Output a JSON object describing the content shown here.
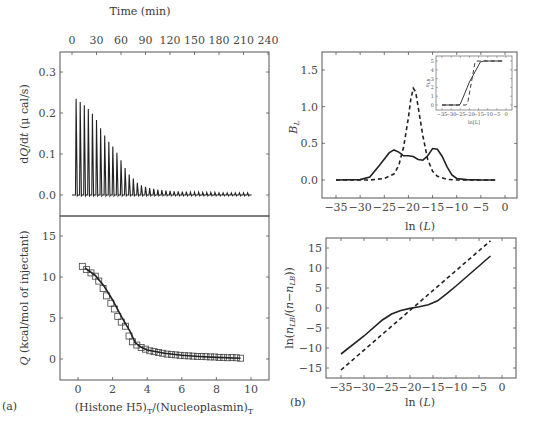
{
  "panels": {
    "a_label": "(a)",
    "b_label": "(b)"
  },
  "chart_data": [
    {
      "id": "itc-thermogram",
      "type": "line",
      "title": "",
      "xlabel": "Time (min)",
      "ylabel": "dQ/dt (μ cal/s)",
      "x_ticks": [
        "0",
        "30",
        "60",
        "90",
        "120",
        "150",
        "180",
        "210",
        "240"
      ],
      "y_ticks": [
        "0.0",
        "0.1",
        "0.2",
        "0.3"
      ],
      "xlim": [
        0,
        240
      ],
      "ylim": [
        -0.05,
        0.35
      ],
      "grid": false,
      "series": [
        {
          "name": "injection peaks",
          "peak_times_min": [
            5,
            10,
            15,
            20,
            25,
            30,
            35,
            40,
            45,
            50,
            55,
            60,
            65,
            70,
            75,
            80,
            85,
            90,
            95,
            100,
            105,
            110,
            115,
            120,
            125,
            130,
            135,
            140,
            145,
            150,
            155,
            160,
            165,
            170,
            175,
            180,
            185,
            190,
            195,
            200,
            205,
            210,
            215
          ],
          "peak_heights": [
            0.235,
            0.227,
            0.219,
            0.21,
            0.198,
            0.183,
            0.163,
            0.145,
            0.13,
            0.118,
            0.103,
            0.085,
            0.066,
            0.05,
            0.04,
            0.03,
            0.024,
            0.02,
            0.017,
            0.015,
            0.013,
            0.012,
            0.011,
            0.01,
            0.009,
            0.009,
            0.008,
            0.008,
            0.007,
            0.007,
            0.007,
            0.006,
            0.006,
            0.006,
            0.006,
            0.005,
            0.005,
            0.005,
            0.005,
            0.005,
            0.005,
            0.005,
            0.005
          ]
        }
      ]
    },
    {
      "id": "binding-isotherm",
      "type": "scatter",
      "xlabel": "(Histone H5)T/(Nucleoplasmin)T",
      "xlabel_main": "(Histone H5)",
      "xlabel_sub1": "T",
      "xlabel_mid": "/(Nucleoplasmin)",
      "xlabel_sub2": "T",
      "ylabel": "Q (kcal/mol of injectant)",
      "x_ticks": [
        "0",
        "2",
        "4",
        "6",
        "8",
        "10"
      ],
      "y_ticks": [
        "0",
        "5",
        "10",
        "15"
      ],
      "xlim": [
        -1,
        11
      ],
      "ylim": [
        -2.5,
        17.5
      ],
      "series": [
        {
          "name": "data (squares)",
          "x": [
            0.25,
            0.5,
            0.75,
            1.0,
            1.2,
            1.45,
            1.65,
            1.9,
            2.1,
            2.3,
            2.5,
            2.75,
            2.95,
            3.15,
            3.4,
            3.65,
            3.9,
            4.15,
            4.4,
            4.65,
            4.9,
            5.15,
            5.4,
            5.65,
            5.9,
            6.15,
            6.4,
            6.65,
            6.9,
            7.15,
            7.4,
            7.65,
            7.9,
            8.15,
            8.4,
            8.65,
            8.9,
            9.15,
            9.4
          ],
          "y": [
            11.3,
            10.9,
            10.5,
            10.1,
            9.5,
            8.6,
            7.7,
            6.8,
            6.1,
            5.2,
            4.5,
            4.0,
            2.8,
            2.1,
            1.7,
            1.4,
            1.2,
            1.0,
            0.9,
            0.8,
            0.7,
            0.6,
            0.55,
            0.5,
            0.45,
            0.4,
            0.38,
            0.35,
            0.3,
            0.3,
            0.28,
            0.25,
            0.25,
            0.2,
            0.2,
            0.15,
            0.2,
            0.15,
            0.1
          ]
        },
        {
          "name": "fit (line)",
          "x": [
            0.4,
            1.0,
            1.5,
            2.0,
            2.5,
            3.0,
            3.3,
            3.6,
            4.0,
            5.0,
            6.0,
            7.0,
            8.0,
            9.4
          ],
          "y": [
            11.1,
            10.2,
            8.9,
            7.2,
            5.2,
            3.4,
            2.0,
            1.5,
            1.1,
            0.7,
            0.45,
            0.3,
            0.2,
            0.1
          ]
        }
      ]
    },
    {
      "id": "binding-capacity",
      "type": "line",
      "xlabel": "ln (L)",
      "ylabel": "B_L",
      "x_ticks": [
        "-35",
        "-30",
        "-25",
        "-20",
        "-15",
        "-10",
        "-5",
        "0"
      ],
      "y_ticks": [
        "0.0",
        "0.5",
        "1.0",
        "1.5"
      ],
      "xlim": [
        -38,
        2.5
      ],
      "ylim": [
        -0.25,
        1.75
      ],
      "series": [
        {
          "name": "solid",
          "style": "solid",
          "x": [
            -35,
            -30,
            -28,
            -26,
            -24,
            -23,
            -22,
            -21,
            -20,
            -19,
            -18,
            -17,
            -16,
            -15,
            -14,
            -13,
            -12,
            -11,
            -10,
            -8,
            -5,
            -2
          ],
          "y": [
            0,
            0.005,
            0.04,
            0.2,
            0.37,
            0.41,
            0.38,
            0.33,
            0.33,
            0.32,
            0.28,
            0.27,
            0.33,
            0.43,
            0.42,
            0.32,
            0.18,
            0.07,
            0.02,
            0.005,
            0,
            0
          ]
        },
        {
          "name": "dashed",
          "style": "dashed",
          "x": [
            -35,
            -28,
            -25,
            -23,
            -22,
            -21,
            -20,
            -19.5,
            -19,
            -18.5,
            -18,
            -17,
            -16,
            -15,
            -14,
            -12,
            -10,
            -5,
            -2
          ],
          "y": [
            0,
            0,
            0.02,
            0.08,
            0.2,
            0.45,
            0.85,
            1.1,
            1.25,
            1.2,
            1.0,
            0.6,
            0.28,
            0.12,
            0.05,
            0.01,
            0,
            0,
            0
          ]
        }
      ],
      "inset": {
        "xlabel": "ln[L]",
        "ylabel": "n_LB",
        "x_ticks": [
          "-35",
          "-30",
          "-25",
          "-20",
          "-15",
          "-10",
          "-5",
          "0"
        ],
        "y_ticks": [
          "0",
          "1",
          "2",
          "3",
          "4",
          "5"
        ],
        "series": [
          {
            "name": "solid",
            "style": "solid",
            "x": [
              -35,
              -26,
              -25,
              -20,
              -14,
              -12,
              -2
            ],
            "y": [
              0,
              0,
              0.1,
              2.6,
              4.9,
              5,
              5
            ]
          },
          {
            "name": "dashed",
            "style": "dashed",
            "x": [
              -35,
              -22,
              -21,
              -19,
              -17,
              -16,
              -2
            ],
            "y": [
              0,
              0,
              0.2,
              2.5,
              4.8,
              5,
              5
            ]
          }
        ]
      }
    },
    {
      "id": "hill-plot",
      "type": "line",
      "xlabel": "ln (L)",
      "ylabel": "ln(n_LB/(n−n_LB))",
      "x_ticks": [
        "-35",
        "-30",
        "-25",
        "-20",
        "-15",
        "-10",
        "-5",
        "0"
      ],
      "y_ticks": [
        "-15",
        "-10",
        "-5",
        "0",
        "5",
        "10",
        "15"
      ],
      "xlim": [
        -38,
        2.5
      ],
      "ylim": [
        -17.5,
        17.5
      ],
      "series": [
        {
          "name": "solid",
          "style": "solid",
          "x": [
            -35,
            -30,
            -26,
            -24,
            -22,
            -20,
            -18,
            -16,
            -14,
            -12,
            -10,
            -6,
            -2.5
          ],
          "y": [
            -11.5,
            -7,
            -3,
            -1.5,
            -0.6,
            -0.1,
            0.3,
            0.8,
            1.8,
            3.6,
            5.5,
            9.5,
            13
          ]
        },
        {
          "name": "dashed",
          "style": "dashed",
          "x": [
            -35,
            -2.5
          ],
          "y": [
            -15.5,
            16.8
          ]
        }
      ]
    }
  ]
}
